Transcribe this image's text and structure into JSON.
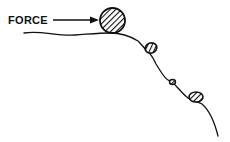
{
  "diagram": {
    "label": "FORCE",
    "colors": {
      "ink": "#111111",
      "background": "#ffffff"
    },
    "elements": [
      {
        "name": "force-label",
        "text": "FORCE"
      },
      {
        "name": "force-arrow",
        "kind": "arrow"
      },
      {
        "name": "large-boulder",
        "kind": "hatched-rock"
      },
      {
        "name": "rock-1",
        "kind": "hatched-rock"
      },
      {
        "name": "pebble",
        "kind": "hatched-rock"
      },
      {
        "name": "rock-2",
        "kind": "hatched-rock"
      },
      {
        "name": "slope-line",
        "kind": "ground"
      }
    ]
  }
}
